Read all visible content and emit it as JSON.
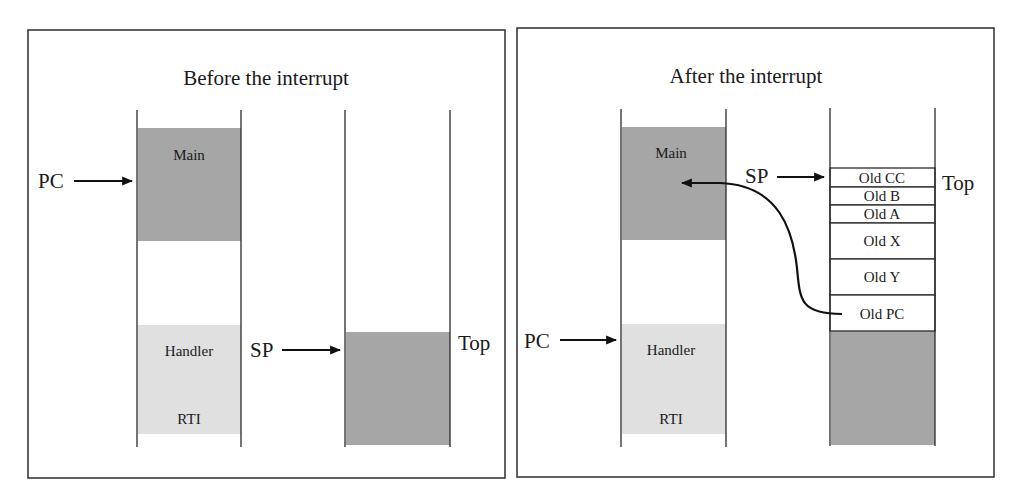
{
  "colors": {
    "main_block": "#a6a6a6",
    "handler_block": "#e0e0e0",
    "stack_used": "#a6a6a6",
    "line": "#2a2a2a",
    "background": "#ffffff"
  },
  "panels": [
    {
      "id": "before",
      "title": "Before the interrupt",
      "memory": {
        "main_label": "Main",
        "handler_label": "Handler",
        "rti_label": "RTI"
      },
      "pc_label": "PC",
      "pc_points_to": "Main",
      "sp_label": "SP",
      "top_label": "Top",
      "stack_frames": []
    },
    {
      "id": "after",
      "title": "After the interrupt",
      "memory": {
        "main_label": "Main",
        "handler_label": "Handler",
        "rti_label": "RTI"
      },
      "pc_label": "PC",
      "pc_points_to": "Handler",
      "sp_label": "SP",
      "top_label": "Top",
      "stack_frames": [
        {
          "label": "Old CC"
        },
        {
          "label": "Old B"
        },
        {
          "label": "Old A"
        },
        {
          "label": "Old X"
        },
        {
          "label": "Old Y"
        },
        {
          "label": "Old PC"
        }
      ],
      "return_arrow": {
        "from": "Old PC",
        "to": "Main"
      }
    }
  ]
}
